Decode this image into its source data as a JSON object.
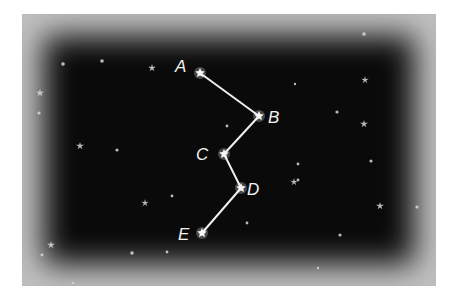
{
  "diagram": {
    "background_color": "#0a0a0a",
    "line_color": "#f0f0f0",
    "star_color": "#d8d8d8",
    "points": [
      {
        "label": "A",
        "x": 200,
        "y": 73,
        "lx": 175,
        "ly": 72
      },
      {
        "label": "B",
        "x": 259,
        "y": 116,
        "lx": 268,
        "ly": 123
      },
      {
        "label": "C",
        "x": 224,
        "y": 154,
        "lx": 196,
        "ly": 160
      },
      {
        "label": "D",
        "x": 241,
        "y": 188,
        "lx": 247,
        "ly": 195
      },
      {
        "label": "E",
        "x": 202,
        "y": 233,
        "lx": 178,
        "ly": 240
      }
    ],
    "connections": [
      [
        "A",
        "B"
      ],
      [
        "B",
        "C"
      ],
      [
        "C",
        "D"
      ],
      [
        "D",
        "E"
      ]
    ],
    "background_stars": [
      {
        "x": 63,
        "y": 64,
        "r": 1.8
      },
      {
        "x": 102,
        "y": 61,
        "r": 1.8
      },
      {
        "x": 152,
        "y": 68,
        "r": 2.6
      },
      {
        "x": 364,
        "y": 34,
        "r": 1.8
      },
      {
        "x": 40,
        "y": 93,
        "r": 2.6
      },
      {
        "x": 39,
        "y": 113,
        "r": 1.6
      },
      {
        "x": 295,
        "y": 84,
        "r": 1.2
      },
      {
        "x": 365,
        "y": 80,
        "r": 2.4
      },
      {
        "x": 337,
        "y": 112,
        "r": 1.6
      },
      {
        "x": 364,
        "y": 124,
        "r": 2.6
      },
      {
        "x": 80,
        "y": 146,
        "r": 2.6
      },
      {
        "x": 117,
        "y": 150,
        "r": 1.6
      },
      {
        "x": 227,
        "y": 126,
        "r": 1.4
      },
      {
        "x": 298,
        "y": 164,
        "r": 1.4
      },
      {
        "x": 371,
        "y": 161,
        "r": 1.6
      },
      {
        "x": 294,
        "y": 182,
        "r": 2.4
      },
      {
        "x": 145,
        "y": 203,
        "r": 2.4
      },
      {
        "x": 172,
        "y": 196,
        "r": 1.4
      },
      {
        "x": 298,
        "y": 180,
        "r": 1.4
      },
      {
        "x": 380,
        "y": 206,
        "r": 2.6
      },
      {
        "x": 417,
        "y": 207,
        "r": 1.6
      },
      {
        "x": 247,
        "y": 223,
        "r": 1.4
      },
      {
        "x": 340,
        "y": 235,
        "r": 1.6
      },
      {
        "x": 51,
        "y": 245,
        "r": 2.6
      },
      {
        "x": 42,
        "y": 255,
        "r": 1.4
      },
      {
        "x": 132,
        "y": 253,
        "r": 1.8
      },
      {
        "x": 167,
        "y": 252,
        "r": 1.4
      },
      {
        "x": 318,
        "y": 268,
        "r": 1.2
      },
      {
        "x": 73,
        "y": 283,
        "r": 1.2
      }
    ]
  }
}
